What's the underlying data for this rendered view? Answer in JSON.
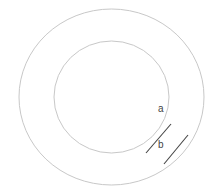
{
  "diagram": {
    "type": "concentric-rings",
    "background": "#ffffff",
    "outer_circle": {
      "cx": 111.5,
      "cy": 97,
      "rx": 92.5,
      "ry": 88,
      "stroke": "#c8c8c8"
    },
    "inner_circle": {
      "cx": 111.5,
      "cy": 97,
      "rx": 57.5,
      "ry": 56,
      "stroke": "#c8c8c8"
    },
    "segments": [
      {
        "id": "line-1",
        "x1": 146,
        "y1": 153,
        "x2": 171,
        "y2": 124,
        "stroke": "#444444"
      },
      {
        "id": "line-2",
        "x1": 164,
        "y1": 164,
        "x2": 188,
        "y2": 135,
        "stroke": "#444444"
      }
    ],
    "labels": [
      {
        "id": "a",
        "text": "a",
        "x": 158,
        "y": 112
      },
      {
        "id": "b",
        "text": "b",
        "x": 158,
        "y": 148
      }
    ]
  }
}
